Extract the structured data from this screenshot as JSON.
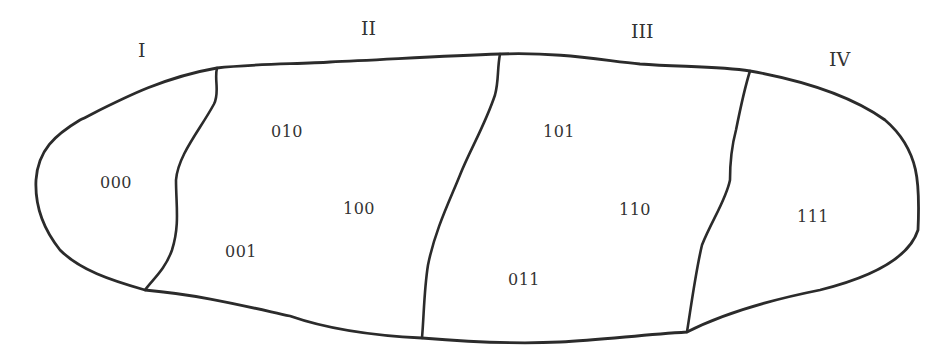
{
  "diagram": {
    "type": "partitioned-region",
    "sections": [
      {
        "label": "I",
        "codes": [
          "000"
        ]
      },
      {
        "label": "II",
        "codes": [
          "010",
          "100",
          "001"
        ]
      },
      {
        "label": "III",
        "codes": [
          "101",
          "110",
          "011"
        ]
      },
      {
        "label": "IV",
        "codes": [
          "111"
        ]
      }
    ],
    "labels": {
      "s1": "I",
      "s2": "II",
      "s3": "III",
      "s4": "IV"
    },
    "codes": {
      "c000": "000",
      "c010": "010",
      "c100": "100",
      "c001": "001",
      "c101": "101",
      "c110": "110",
      "c011": "011",
      "c111": "111"
    },
    "colors": {
      "stroke": "#2b2b2b",
      "text": "#333333",
      "background": "#ffffff"
    }
  }
}
